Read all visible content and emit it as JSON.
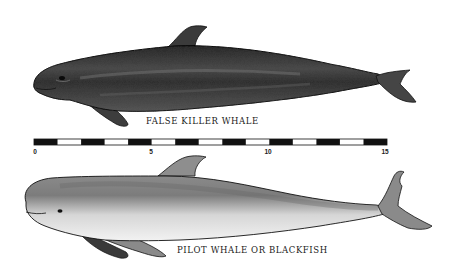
{
  "illustration": {
    "whales": [
      {
        "name": "false-killer-whale",
        "caption": "FALSE KILLER WHALE",
        "tone": "#3a3a3a"
      },
      {
        "name": "pilot-whale",
        "caption": "PILOT WHALE OR BLACKFISH",
        "tone": "#9a9a9a"
      }
    ],
    "scale_bar": {
      "segments": 15,
      "labels": [
        "0",
        "5",
        "10",
        "15"
      ],
      "start_x": 34,
      "end_x": 387
    }
  }
}
